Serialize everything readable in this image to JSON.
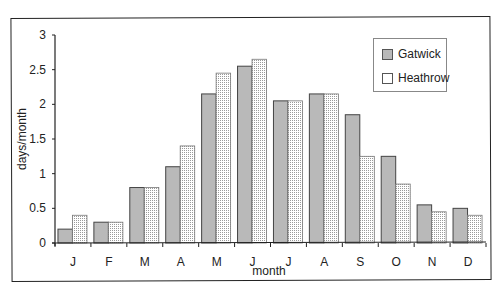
{
  "chart_data": {
    "type": "bar",
    "title": "",
    "xlabel": "month",
    "ylabel": "days/month",
    "ylim": [
      0,
      3
    ],
    "yticks": [
      0,
      0.5,
      1,
      1.5,
      2,
      2.5,
      3
    ],
    "ytick_labels": [
      "0",
      "0.5",
      "1",
      "1.5",
      "2",
      "2.5",
      "3"
    ],
    "categories": [
      "J",
      "F",
      "M",
      "A",
      "M",
      "J",
      "J",
      "A",
      "S",
      "O",
      "N",
      "D"
    ],
    "series": [
      {
        "name": "Gatwick",
        "color": "#b9b9b9",
        "pattern": "solid",
        "values": [
          0.2,
          0.3,
          0.8,
          1.1,
          2.15,
          2.55,
          2.05,
          2.15,
          1.85,
          1.25,
          0.55,
          0.5
        ]
      },
      {
        "name": "Heathrow",
        "color": "#f2f2f2",
        "pattern": "dotted",
        "values": [
          0.4,
          0.3,
          0.8,
          1.4,
          2.45,
          2.65,
          2.05,
          2.15,
          1.25,
          0.85,
          0.45,
          0.4
        ]
      }
    ],
    "grid": false,
    "legend_position": "upper right"
  },
  "legend": {
    "items": [
      {
        "label": "Gatwick"
      },
      {
        "label": "Heathrow"
      }
    ]
  }
}
